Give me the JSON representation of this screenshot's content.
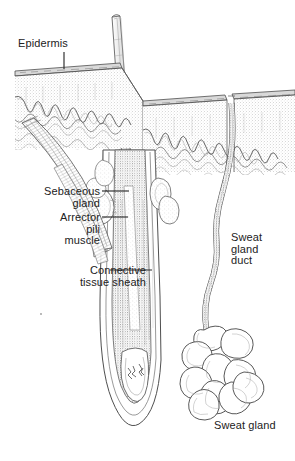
{
  "figure": {
    "style": "pen-and-ink stipple line drawing, grayscale",
    "background_color": "#ffffff",
    "ink_color": "#3a3a3a",
    "label_color": "#222222"
  },
  "labels": {
    "epidermis": "Epidermis",
    "sebaceous_gland": "Sebaceous\ngland",
    "arrector_pili_muscle": "Arrector\npili\nmuscle",
    "connective_tissue_sheath": "Connective\ntissue sheath",
    "sweat_gland_duct": "Sweat\ngland\nduct",
    "sweat_gland": "Sweat gland"
  },
  "structures": [
    {
      "name": "hair-shaft",
      "description": "hair emerging above skin surface, tilted"
    },
    {
      "name": "epidermis-block",
      "description": "stippled surface layer with scalloped papillae"
    },
    {
      "name": "dermis-papillae",
      "description": "wavy rows of dermal ridges beneath epidermis"
    },
    {
      "name": "hair-follicle",
      "description": "long tube descending from surface to bulb"
    },
    {
      "name": "sebaceous-gland",
      "description": "lobed gland clusters beside follicle"
    },
    {
      "name": "arrector-pili-muscle",
      "description": "diagonal muscle band from follicle to epidermis"
    },
    {
      "name": "connective-tissue-sheath",
      "description": "outer layers surrounding the follicle"
    },
    {
      "name": "hair-bulb",
      "description": "bulbous base with dermal papilla"
    },
    {
      "name": "sweat-gland-duct",
      "description": "wavy tube from skin notch down to coil"
    },
    {
      "name": "sweat-gland",
      "description": "tangled coil of secretory tubules"
    }
  ]
}
